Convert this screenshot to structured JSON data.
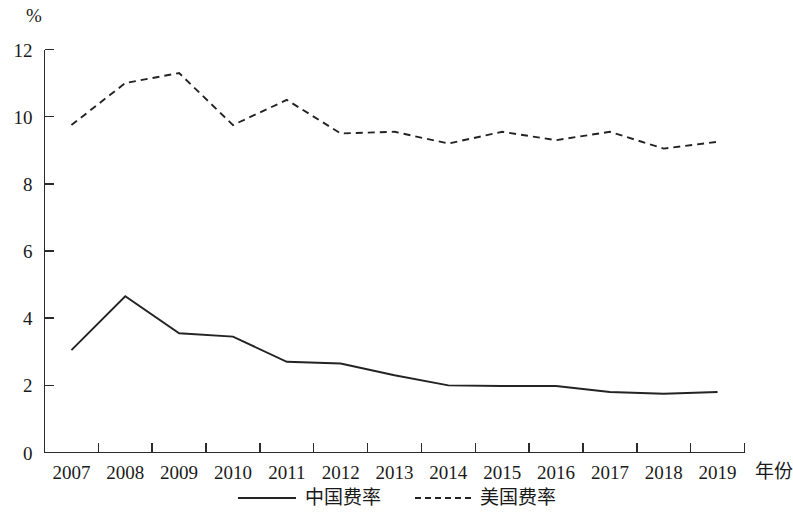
{
  "chart_data": {
    "type": "line",
    "title": "",
    "subtitle": "",
    "xlabel": "年份",
    "ylabel": "%",
    "x": [
      2007,
      2008,
      2009,
      2010,
      2011,
      2012,
      2013,
      2014,
      2015,
      2016,
      2017,
      2018,
      2019
    ],
    "categories": [
      "2007",
      "2008",
      "2009",
      "2010",
      "2011",
      "2012",
      "2013",
      "2014",
      "2015",
      "2016",
      "2017",
      "2018",
      "2019"
    ],
    "series": [
      {
        "name": "中国费率",
        "style": "solid",
        "color": "#232323",
        "values": [
          3.05,
          4.65,
          3.55,
          3.45,
          2.7,
          2.65,
          2.3,
          2.0,
          1.98,
          1.98,
          1.8,
          1.75,
          1.8
        ]
      },
      {
        "name": "美国费率",
        "style": "dashed",
        "color": "#232323",
        "values": [
          9.75,
          11.0,
          11.3,
          9.75,
          10.5,
          9.5,
          9.55,
          9.2,
          9.55,
          9.3,
          9.55,
          9.05,
          9.25
        ]
      }
    ],
    "ylim": [
      0,
      12
    ],
    "ytick_values": [
      0,
      2,
      4,
      6,
      8,
      10,
      12
    ],
    "ytick_labels": [
      "0",
      "2",
      "4",
      "6",
      "8",
      "10",
      "12"
    ],
    "xtick_labels": [
      "2007",
      "2008",
      "2009",
      "2010",
      "2011",
      "2012",
      "2013",
      "2014",
      "2015",
      "2016",
      "2017",
      "2018",
      "2019"
    ],
    "grid": false,
    "legend_position": "bottom",
    "legend": [
      {
        "label": "中国费率",
        "style": "solid"
      },
      {
        "label": "美国费率",
        "style": "dashed"
      }
    ]
  },
  "legend": {
    "entries": [
      {
        "label": "中国费率"
      },
      {
        "label": "美国费率"
      }
    ]
  },
  "axes": {
    "y_unit_label": "%",
    "x_axis_label": "年份"
  }
}
